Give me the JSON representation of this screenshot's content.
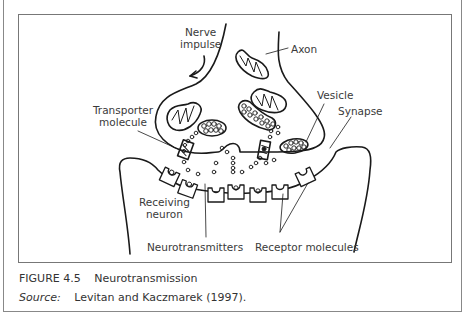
{
  "figure": {
    "number": "FIGURE 4.5",
    "title": "Neurotransmission",
    "source_label": "Source:",
    "source_text": "Levitan and Kaczmarek (1997)."
  },
  "labels": {
    "nerve_impulse_line1": "Nerve",
    "nerve_impulse_line2": "impulse",
    "axon": "Axon",
    "transporter_line1": "Transporter",
    "transporter_line2": "molecule",
    "vesicle": "Vesicle",
    "synapse": "Synapse",
    "receiving_line1": "Receiving",
    "receiving_line2": "neuron",
    "neurotransmitters": "Neurotransmitters",
    "receptor_molecules": "Receptor molecules"
  },
  "colors": {
    "line": "#1a1a1a",
    "frame": "#888888",
    "text": "#333333"
  }
}
